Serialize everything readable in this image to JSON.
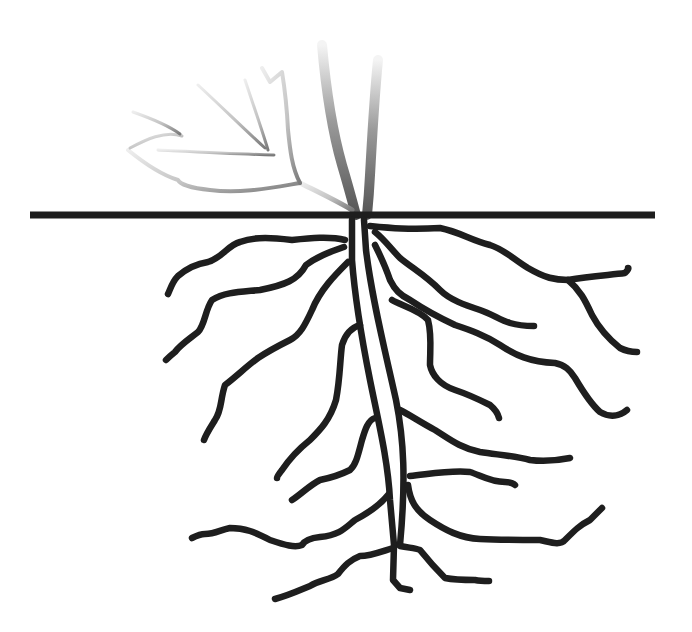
{
  "figure": {
    "description": "Line drawing of a plant root system below a horizontal ground line, with a faded stem and leaf above ground",
    "colors": {
      "root": "#1e1e1e",
      "ground_line": "#1e1e1e",
      "shoot_dark": "#707070",
      "shoot_light": "#e6e6e6",
      "background": "#ffffff"
    },
    "ground_line": {
      "x1": 30,
      "x2": 655,
      "y": 215,
      "thickness": 7
    }
  }
}
